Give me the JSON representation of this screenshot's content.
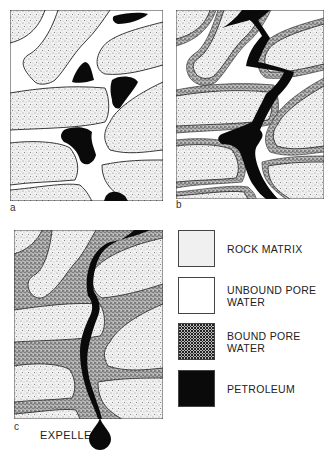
{
  "figure": {
    "panels": [
      {
        "id": "a",
        "label": "a"
      },
      {
        "id": "b",
        "label": "b"
      },
      {
        "id": "c",
        "label": "c"
      }
    ],
    "annotation": {
      "expelled": "EXPELLED"
    },
    "legend": [
      {
        "key": "rock-matrix",
        "label": "ROCK MATRIX",
        "pattern": "fine-stipple",
        "color": "#e8e8e8"
      },
      {
        "key": "unbound-pore-water",
        "label": "UNBOUND PORE WATER",
        "pattern": "blank",
        "color": "#ffffff"
      },
      {
        "key": "bound-pore-water",
        "label": "BOUND PORE WATER",
        "pattern": "dense-stipple",
        "color": "#9a9a9a"
      },
      {
        "key": "petroleum",
        "label": "PETROLEUM",
        "pattern": "solid",
        "color": "#0a0a0a"
      }
    ]
  },
  "colors": {
    "rock": "#ececec",
    "bound_water": "#8f8f8f",
    "petroleum": "#0a0a0a",
    "outline": "#333333"
  }
}
